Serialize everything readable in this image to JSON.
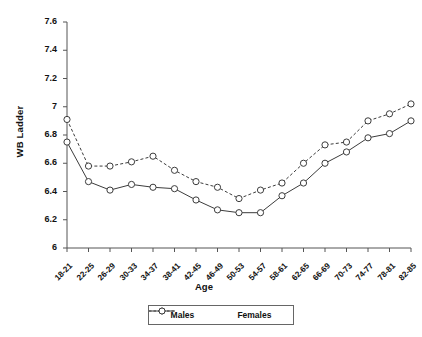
{
  "chart_data": {
    "type": "line",
    "title": "",
    "xlabel": "Age",
    "ylabel": "WB Ladder",
    "categories": [
      "18-21",
      "22-25",
      "26-29",
      "30-33",
      "34-37",
      "38-41",
      "42-45",
      "46-49",
      "50-53",
      "54-57",
      "58-61",
      "62-65",
      "66-69",
      "70-73",
      "74-77",
      "78-81",
      "82-85"
    ],
    "ylim": [
      6,
      7.6
    ],
    "yticks": [
      "6",
      "6.2",
      "6.4",
      "6.6",
      "6.8",
      "7",
      "7.2",
      "7.4",
      "7.6"
    ],
    "ytick_values": [
      6,
      6.2,
      6.4,
      6.6,
      6.8,
      7,
      7.2,
      7.4,
      7.6
    ],
    "grid": false,
    "legend_position": "bottom",
    "series": [
      {
        "name": "Males",
        "style": "solid",
        "marker": "circle",
        "color": "#3c3c3c",
        "values": [
          6.75,
          6.47,
          6.41,
          6.45,
          6.43,
          6.42,
          6.34,
          6.27,
          6.25,
          6.25,
          6.37,
          6.46,
          6.6,
          6.68,
          6.78,
          6.81,
          6.9
        ]
      },
      {
        "name": "Females",
        "style": "dashed",
        "marker": "circle",
        "color": "#3c3c3c",
        "values": [
          6.91,
          6.58,
          6.58,
          6.61,
          6.65,
          6.55,
          6.47,
          6.43,
          6.35,
          6.41,
          6.46,
          6.6,
          6.73,
          6.75,
          6.9,
          6.95,
          7.02
        ]
      }
    ]
  },
  "axes": {
    "y_title": "WB Ladder",
    "x_title": "Age"
  },
  "legend": {
    "items": [
      {
        "label": "Males"
      },
      {
        "label": "Females"
      }
    ]
  },
  "colors": {
    "axis": "#555555",
    "line": "#3c3c3c",
    "marker_fill": "#ffffff",
    "background": "#ffffff"
  }
}
